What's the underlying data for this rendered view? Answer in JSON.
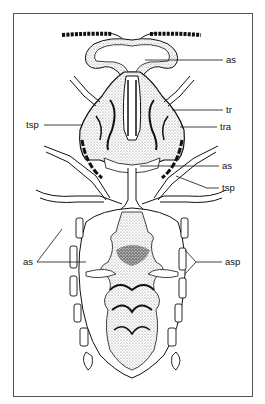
{
  "figure": {
    "type": "anatomical-diagram",
    "labels": [
      {
        "id": "as-head",
        "text": "as",
        "x": 226,
        "y": 55
      },
      {
        "id": "tr",
        "text": "tr",
        "x": 226,
        "y": 105
      },
      {
        "id": "tsp-left",
        "text": "tsp",
        "x": 26,
        "y": 120
      },
      {
        "id": "tra",
        "text": "tra",
        "x": 220,
        "y": 122
      },
      {
        "id": "as-thorax",
        "text": "as",
        "x": 222,
        "y": 161
      },
      {
        "id": "tsp-right",
        "text": "tsp",
        "x": 222,
        "y": 183
      },
      {
        "id": "as-abdomen",
        "text": "as",
        "x": 23,
        "y": 257
      },
      {
        "id": "asp",
        "text": "asp",
        "x": 225,
        "y": 257
      }
    ]
  },
  "colors": {
    "ink": "#111111",
    "stipple": "#9a9a9a",
    "frame": "#555555",
    "background": "#ffffff"
  }
}
